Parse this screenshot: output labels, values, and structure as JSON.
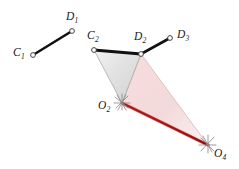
{
  "figure": {
    "kind": "kinematic-linkage-diagram",
    "width": 239,
    "height": 169,
    "background_color": "#ffffff"
  },
  "colors": {
    "link_black": "#111111",
    "marker_stroke": "#3a3a3a",
    "marker_fill": "#ffffff",
    "gray_triangle_fill": "#e3e3e3",
    "gray_triangle_edge": "#9a9a9a",
    "pink_triangle_fill": "#f6dede",
    "pink_triangle_edge": "#c9a9a9",
    "red_link": "#a81414",
    "red_link_highlight": "#e05a5a",
    "pivot_hatch": "#8c8c8c",
    "label_color": "#1a1a1a"
  },
  "points": [
    {
      "id": "C1",
      "letter": "C",
      "sub": "1",
      "x": 33,
      "y": 55,
      "label_x": 13,
      "label_y": 47,
      "marker": "open-circle"
    },
    {
      "id": "D1",
      "letter": "D",
      "sub": "1",
      "x": 72,
      "y": 31,
      "label_x": 66,
      "label_y": 11,
      "marker": "open-circle"
    },
    {
      "id": "C2",
      "letter": "C",
      "sub": "2",
      "x": 94,
      "y": 50,
      "label_x": 87,
      "label_y": 30,
      "marker": "open-circle"
    },
    {
      "id": "D2",
      "letter": "D",
      "sub": "2",
      "x": 141,
      "y": 54,
      "label_x": 134,
      "label_y": 31,
      "marker": "open-circle"
    },
    {
      "id": "D3",
      "letter": "D",
      "sub": "3",
      "x": 170,
      "y": 38,
      "label_x": 177,
      "label_y": 29,
      "marker": "open-circle"
    },
    {
      "id": "O2",
      "letter": "O",
      "sub": "2",
      "x": 122,
      "y": 103,
      "label_x": 98,
      "label_y": 100,
      "marker": "ground-pivot"
    },
    {
      "id": "O4",
      "letter": "O",
      "sub": "4",
      "x": 208,
      "y": 145,
      "label_x": 214,
      "label_y": 148,
      "marker": "ground-pivot"
    }
  ],
  "links": [
    {
      "id": "C1-D1",
      "from": "C1",
      "to": "D1",
      "style": "thick-black",
      "width": 2.6
    },
    {
      "id": "C2-D2",
      "from": "C2",
      "to": "D2",
      "style": "thick-black",
      "width": 2.8
    },
    {
      "id": "D2-D3",
      "from": "D2",
      "to": "D3",
      "style": "thick-black",
      "width": 2.6
    },
    {
      "id": "O2-O4",
      "from": "O2",
      "to": "O4",
      "style": "red-ground-link",
      "width": 2.6
    }
  ],
  "polygons": [
    {
      "id": "coupler-triangle-gray",
      "vertices": [
        "C2",
        "D2",
        "O2"
      ],
      "fill": "gray_triangle_fill",
      "stroke": "gray_triangle_edge"
    },
    {
      "id": "coupler-triangle-pink",
      "vertices": [
        "D2",
        "O2",
        "O4"
      ],
      "fill": "pink_triangle_fill",
      "stroke": "pink_triangle_edge"
    }
  ],
  "labels": {
    "C1": "C",
    "C1_sub": "1",
    "D1": "D",
    "D1_sub": "1",
    "C2": "C",
    "C2_sub": "2",
    "D2": "D",
    "D2_sub": "2",
    "D3": "D",
    "D3_sub": "3",
    "O2": "O",
    "O2_sub": "2",
    "O4": "O",
    "O4_sub": "4"
  }
}
